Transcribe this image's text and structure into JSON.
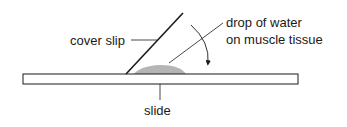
{
  "diagram": {
    "labels": {
      "cover_slip": "cover slip",
      "drop_line1": "drop of water",
      "drop_line2": "on muscle tissue",
      "slide": "slide"
    },
    "colors": {
      "stroke": "#1a1a1a",
      "drop_fill": "#b5b5b5",
      "slide_fill": "#ffffff"
    }
  }
}
